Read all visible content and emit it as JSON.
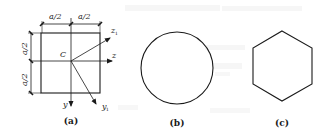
{
  "figure": {
    "panels": [
      {
        "id": "a",
        "caption": "(a)",
        "shape": "square",
        "dimensions": {
          "top_left": "a/2",
          "top_right": "a/2",
          "left_top": "a/2",
          "left_bottom": "a/2"
        },
        "centroid_label": "C",
        "axes": {
          "y": "y",
          "z": "z",
          "y1": "y",
          "y1_sub": "1",
          "z1": "z",
          "z1_sub": "1"
        }
      },
      {
        "id": "b",
        "caption": "(b)",
        "shape": "circle"
      },
      {
        "id": "c",
        "caption": "(c)",
        "shape": "hexagon"
      }
    ],
    "colors": {
      "line": "#1a1a1a",
      "background": "#ffffff",
      "bleed_through": "#e8e8e8"
    }
  }
}
